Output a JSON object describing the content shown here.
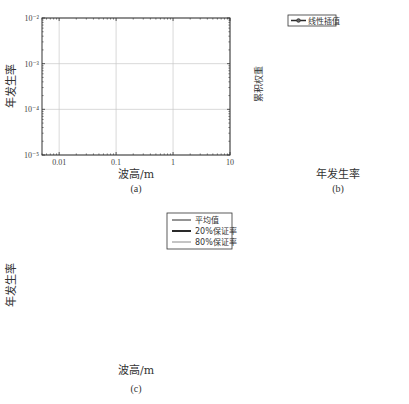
{
  "chart_data": [
    {
      "id": "a",
      "type": "line",
      "caption": "(a)",
      "xlabel": "波高/m",
      "ylabel": "年发生率",
      "xscale": "log",
      "yscale": "log",
      "xlim": [
        0.005,
        10
      ],
      "ylim": [
        1e-05,
        0.01
      ],
      "xticks": [
        0.01,
        0.1,
        1,
        10
      ],
      "xtick_labels": [
        "0.01",
        "0.1",
        "1",
        "10"
      ],
      "yticks": [
        0.01,
        0.001,
        0.0001,
        1e-05
      ],
      "ytick_labels": [
        "10⁻²",
        "10⁻³",
        "10⁻⁴",
        "10⁻⁵"
      ],
      "grid": true,
      "legend": null,
      "series_description": "Ensemble of ~25 gray exceedance curves starting near 1e-2 at 0.005 m and falling to 1e-5 between ~1.5 m and ~9 m",
      "curve_end_x_at_1e-5": [
        1.5,
        1.6,
        1.7,
        1.8,
        1.9,
        2.0,
        2.1,
        2.2,
        2.4,
        2.5,
        2.6,
        2.8,
        3.0,
        3.2,
        3.4,
        3.6,
        3.9,
        4.2,
        4.5,
        4.9,
        5.3,
        6.0,
        6.8,
        7.6,
        8.8
      ]
    },
    {
      "id": "b",
      "type": "line",
      "caption": "(b)",
      "xlabel": "年发生率",
      "ylabel": "累积权重",
      "xscale": "log",
      "xlim": [
        3.8e-05,
        0.00105
      ],
      "ylim": [
        0,
        1.0
      ],
      "xticks": [
        0.0001,
        0.001
      ],
      "xtick_labels": [
        "10⁻⁴",
        "10⁻³"
      ],
      "yticks": [
        0.0,
        0.2,
        0.4,
        0.6,
        0.8,
        1.0
      ],
      "ytick_labels": [
        "0.0",
        "0.2",
        "0.4",
        "0.6",
        "0.8",
        "1.0"
      ],
      "grid": true,
      "hlines_dashed": [
        0.2,
        0.8
      ],
      "legend": {
        "position": "upper-left",
        "entries": [
          "线性插值"
        ]
      },
      "series": [
        {
          "name": "线性插值",
          "marker": "circle",
          "x": [
            5.2e-05,
            7e-05,
            7e-05,
            8e-05,
            8.7e-05,
            0.000124,
            0.00014,
            0.000145,
            0.00015,
            0.00016,
            0.00018,
            0.00027,
            0.000285,
            0.000295,
            0.00031,
            0.00036,
            0.00037,
            0.00041,
            0.00046,
            0.00052,
            0.00058,
            0.00066,
            0.00076
          ],
          "y": [
            0.01,
            0.01,
            0.09,
            0.11,
            0.12,
            0.13,
            0.15,
            0.21,
            0.28,
            0.35,
            0.38,
            0.38,
            0.41,
            0.76,
            0.78,
            0.78,
            0.87,
            0.89,
            0.91,
            0.96,
            0.97,
            0.99,
            1.0
          ]
        }
      ]
    },
    {
      "id": "c",
      "type": "line",
      "caption": "(c)",
      "xlabel": "波高/m",
      "ylabel": "年发生率",
      "xscale": "log",
      "yscale": "log",
      "xlim": [
        0.005,
        10
      ],
      "ylim": [
        1e-05,
        0.01
      ],
      "xticks": [
        0.01,
        0.1,
        1,
        10
      ],
      "xtick_labels": [
        "0.01",
        "0.1",
        "1",
        "10"
      ],
      "yticks": [
        0.01,
        0.001,
        0.0001,
        1e-05
      ],
      "ytick_labels": [
        "10⁻²",
        "10⁻³",
        "10⁻⁴",
        "10⁻⁵"
      ],
      "grid": true,
      "legend": {
        "position": "upper-right",
        "entries": [
          "平均值",
          "20%保证率",
          "80%保证率"
        ]
      },
      "series": [
        {
          "name": "平均值",
          "style": "dark-thin",
          "end_x_at_1e-5": 2.7
        },
        {
          "name": "20%保证率",
          "style": "dark-thick",
          "end_x_at_1e-5": 3.3
        },
        {
          "name": "80%保证率",
          "style": "gray-thin",
          "end_x_at_1e-5": 2.2
        }
      ],
      "background_curve_end_x_at_1e-5": [
        1.5,
        1.6,
        1.7,
        1.8,
        1.9,
        2.0,
        2.1,
        2.2,
        2.4,
        2.5,
        2.6,
        2.8,
        3.0,
        3.2,
        3.4,
        3.6,
        3.9,
        4.2,
        4.5,
        4.9,
        5.3,
        6.0,
        6.8,
        7.6,
        8.8
      ]
    }
  ],
  "colors": {
    "curve_gray": "#8a8a8a",
    "curve_dark": "#2a2a2a",
    "grid": "#c8c8c8",
    "axis": "#333333",
    "dashed": "#555555"
  }
}
